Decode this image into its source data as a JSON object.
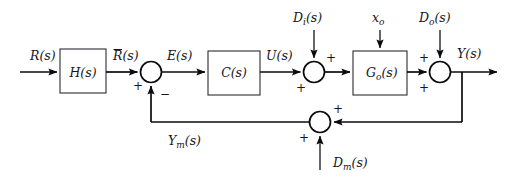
{
  "diagram": {
    "type": "control-block-diagram",
    "stroke_color": "#0b0b0f",
    "block_fill": "#ffffff",
    "background": "#ffffff",
    "blocks": [
      {
        "id": "H",
        "label": "H(s)",
        "x": 60,
        "y": 49,
        "w": 46,
        "h": 44
      },
      {
        "id": "C",
        "label": "C(s)",
        "x": 208,
        "y": 51,
        "w": 52,
        "h": 44
      },
      {
        "id": "Go",
        "label": "G",
        "label_sub": "o",
        "label_tail": "(s)",
        "x": 353,
        "y": 51,
        "w": 54,
        "h": 44
      }
    ],
    "summing_junctions": [
      {
        "id": "sum-error",
        "cx": 151,
        "cy": 72,
        "r": 10.5
      },
      {
        "id": "sum-input-disturbance",
        "cx": 314,
        "cy": 72,
        "r": 10.5
      },
      {
        "id": "sum-output-disturbance",
        "cx": 440,
        "cy": 72,
        "r": 10.5
      },
      {
        "id": "sum-measurement",
        "cx": 320,
        "cy": 122,
        "r": 10.5
      }
    ],
    "signals": {
      "reference": "R(s)",
      "filtered_reference_base": "R",
      "filtered_reference_tail": "(s)",
      "error": "E(s)",
      "control": "U(s)",
      "output": "Y(s)",
      "measured_output_base": "Y",
      "measured_output_sub": "m",
      "measured_output_tail": "(s)",
      "input_disturbance_base": "D",
      "input_disturbance_sub": "i",
      "input_disturbance_tail": "(s)",
      "output_disturbance_base": "D",
      "output_disturbance_sub": "o",
      "output_disturbance_tail": "(s)",
      "measurement_disturbance_base": "D",
      "measurement_disturbance_sub": "m",
      "measurement_disturbance_tail": "(s)",
      "initial_state_base": "x",
      "initial_state_sub": "o"
    },
    "signs": {
      "error_plus": "+",
      "error_minus": "−",
      "input_dist_top_plus": "+",
      "input_dist_bottom_plus": "+",
      "output_dist_top_plus": "+",
      "output_dist_bottom_plus": "+",
      "meas_right_plus": "+",
      "meas_bottom_plus": "+"
    }
  }
}
